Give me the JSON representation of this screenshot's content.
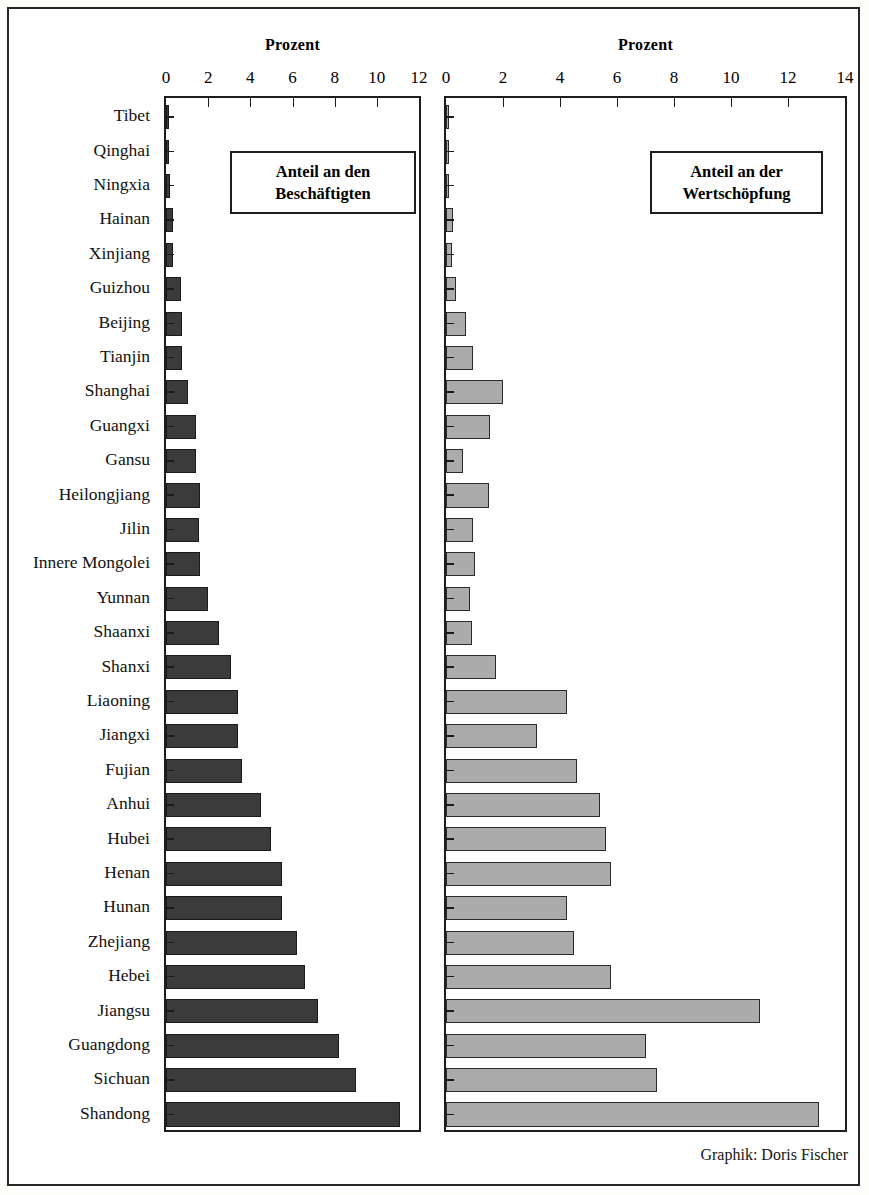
{
  "credit": "Graphik: Doris Fischer",
  "charts": [
    {
      "id": "beschaeftigte",
      "axis_title": "Prozent",
      "legend": {
        "line1": "Anteil an den",
        "line2": "Beschäftigten"
      },
      "xticks": [
        0,
        2,
        4,
        6,
        8,
        10,
        12
      ],
      "xlim": [
        0,
        12
      ]
    },
    {
      "id": "wertschoepfung",
      "axis_title": "Prozent",
      "legend": {
        "line1": "Anteil an der",
        "line2": "Wertschöpfung"
      },
      "xticks": [
        0,
        2,
        4,
        6,
        8,
        10,
        12,
        14
      ],
      "xlim": [
        0,
        14
      ]
    }
  ],
  "chart_data": {
    "type": "bar",
    "orientation": "horizontal",
    "title": "",
    "xlabel": "Prozent",
    "ylabel": "",
    "grid": false,
    "legend_position": "inside-top-right",
    "panels": [
      {
        "name": "Anteil an den Beschäftigten",
        "axis_title": "Prozent",
        "xlim": [
          0,
          12
        ],
        "xticks": [
          0,
          2,
          4,
          6,
          8,
          10,
          12
        ],
        "bar_color": "#3b3b3b"
      },
      {
        "name": "Anteil an der Wertschöpfung",
        "axis_title": "Prozent",
        "xlim": [
          0,
          14
        ],
        "xticks": [
          0,
          2,
          4,
          6,
          8,
          10,
          12,
          14
        ],
        "bar_color": "#ababab"
      }
    ],
    "categories": [
      "Tibet",
      "Qinghai",
      "Ningxia",
      "Hainan",
      "Xinjiang",
      "Guizhou",
      "Beijing",
      "Tianjin",
      "Shanghai",
      "Guangxi",
      "Gansu",
      "Heilongjiang",
      "Jilin",
      "Innere Mongolei",
      "Yunnan",
      "Shaanxi",
      "Shanxi",
      "Liaoning",
      "Jiangxi",
      "Fujian",
      "Anhui",
      "Hubei",
      "Henan",
      "Hunan",
      "Zhejiang",
      "Hebei",
      "Jiangsu",
      "Guangdong",
      "Sichuan",
      "Shandong"
    ],
    "series": [
      {
        "name": "Anteil an den Beschäftigten",
        "panel": 0,
        "unit": "%",
        "values": [
          0.08,
          0.15,
          0.2,
          0.35,
          0.35,
          0.7,
          0.75,
          0.75,
          1.05,
          1.4,
          1.4,
          1.6,
          1.55,
          1.6,
          2.0,
          2.5,
          3.1,
          3.4,
          3.4,
          3.6,
          4.5,
          5.0,
          5.5,
          5.5,
          6.2,
          6.6,
          7.2,
          8.2,
          9.0,
          11.1
        ]
      },
      {
        "name": "Anteil an der Wertschöpfung",
        "panel": 1,
        "unit": "%",
        "values": [
          0.05,
          0.1,
          0.1,
          0.25,
          0.2,
          0.35,
          0.7,
          0.95,
          2.0,
          1.55,
          0.6,
          1.5,
          0.95,
          1.0,
          0.85,
          0.9,
          1.75,
          4.25,
          3.2,
          4.6,
          5.4,
          5.6,
          5.8,
          4.25,
          4.5,
          5.8,
          11.0,
          7.0,
          7.4,
          13.1
        ]
      }
    ]
  }
}
